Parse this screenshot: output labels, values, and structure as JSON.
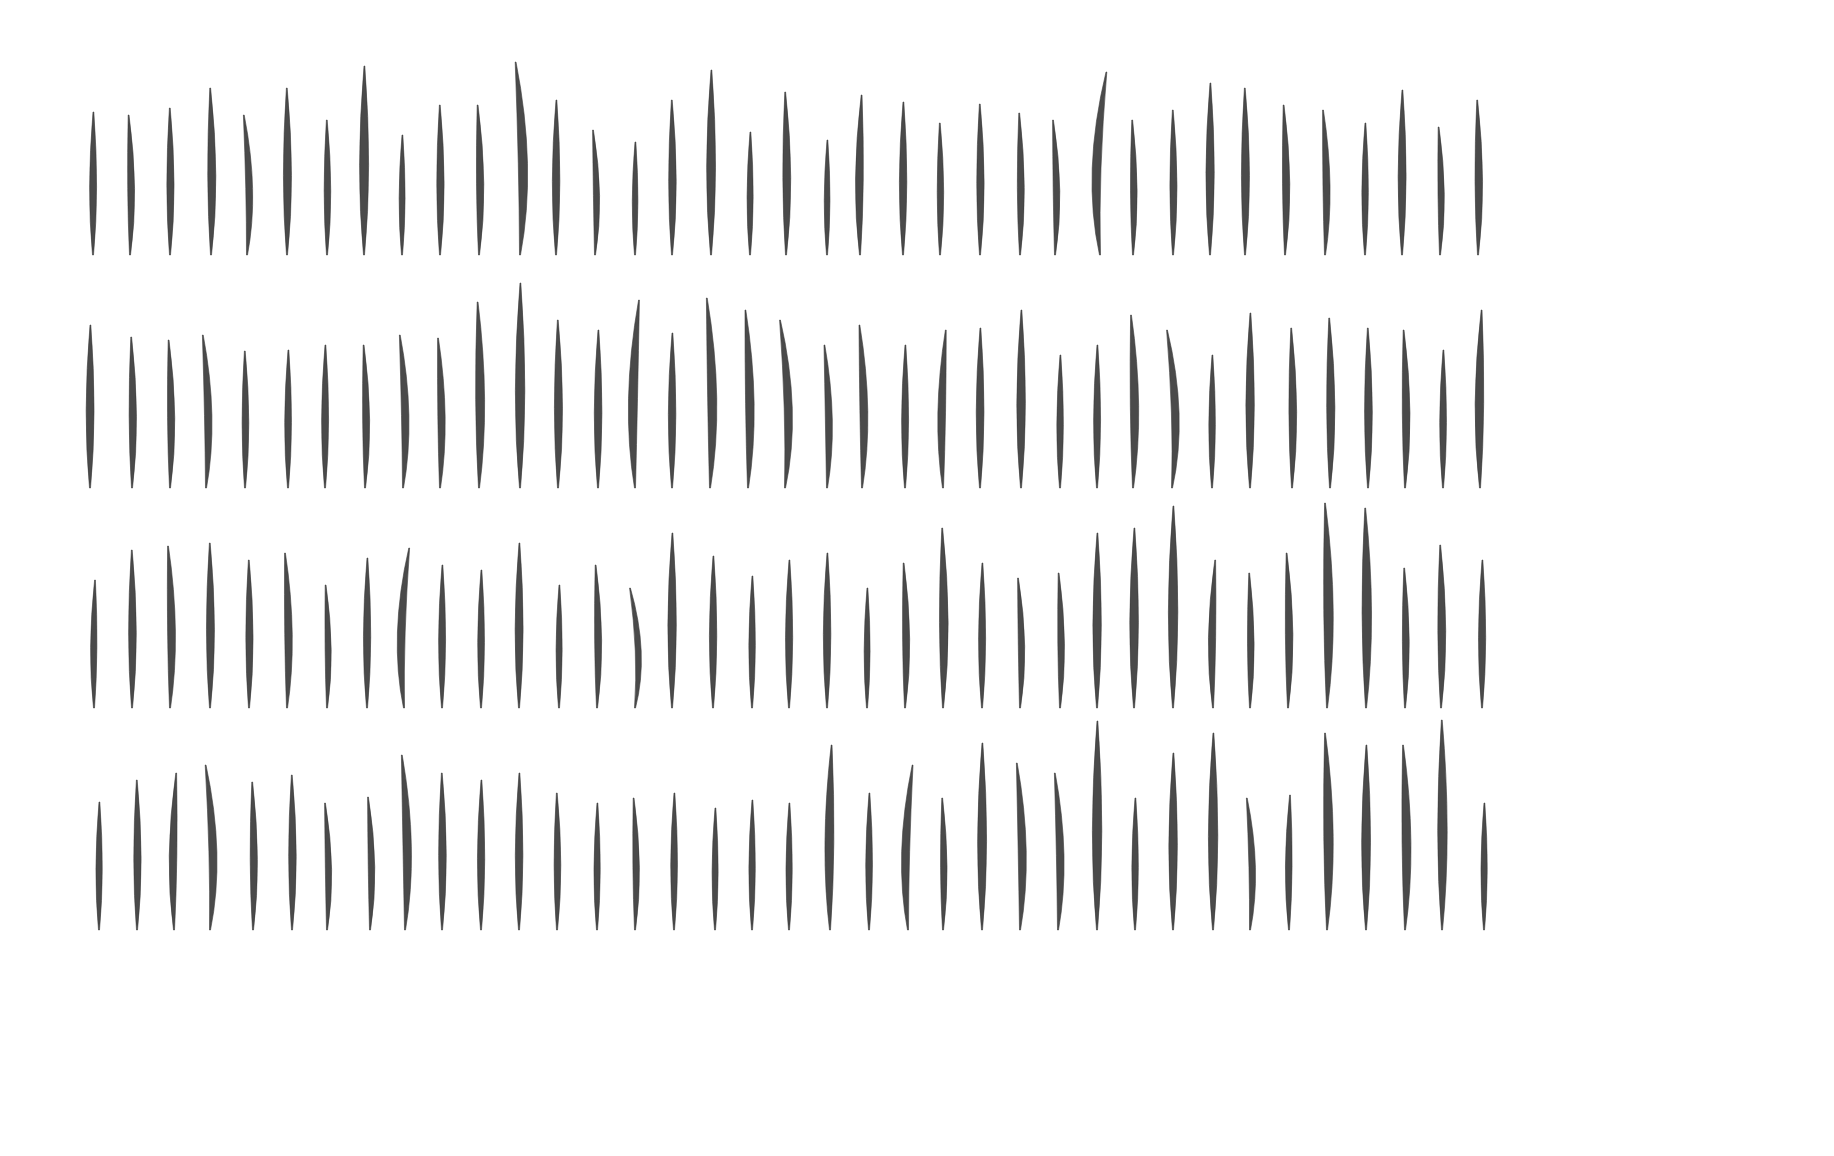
{
  "image": {
    "description": "Four rows of dark grey, narrow, slightly curved leaf-like specimens on a white background",
    "background": "#ffffff",
    "leaf_color": "#4a4a4a"
  },
  "rows": [
    {
      "bottom": 255,
      "leaves": [
        [
          93,
          112,
          0
        ],
        [
          130,
          115,
          3
        ],
        [
          170,
          108,
          1
        ],
        [
          211,
          88,
          2
        ],
        [
          247,
          115,
          6
        ],
        [
          287,
          88,
          1
        ],
        [
          327,
          120,
          1
        ],
        [
          364,
          66,
          0
        ],
        [
          402,
          135,
          0
        ],
        [
          440,
          105,
          1
        ],
        [
          479,
          105,
          3
        ],
        [
          520,
          62,
          8
        ],
        [
          556,
          100,
          0
        ],
        [
          595,
          130,
          4
        ],
        [
          635,
          142,
          0
        ],
        [
          672,
          100,
          1
        ],
        [
          711,
          70,
          0
        ],
        [
          750,
          132,
          0
        ],
        [
          786,
          92,
          2
        ],
        [
          827,
          140,
          0
        ],
        [
          860,
          95,
          -2
        ],
        [
          903,
          102,
          0
        ],
        [
          940,
          123,
          1
        ],
        [
          980,
          104,
          1
        ],
        [
          1020,
          113,
          2
        ],
        [
          1055,
          120,
          4
        ],
        [
          1100,
          72,
          -10
        ],
        [
          1133,
          120,
          2
        ],
        [
          1173,
          110,
          1
        ],
        [
          1210,
          83,
          0
        ],
        [
          1245,
          88,
          1
        ],
        [
          1285,
          105,
          3
        ],
        [
          1325,
          110,
          4
        ],
        [
          1365,
          123,
          0
        ],
        [
          1402,
          90,
          0
        ],
        [
          1440,
          127,
          3
        ],
        [
          1478,
          100,
          2
        ]
      ]
    },
    {
      "bottom": 488,
      "leaves": [
        [
          90,
          325,
          0
        ],
        [
          132,
          337,
          2
        ],
        [
          170,
          340,
          3
        ],
        [
          206,
          335,
          6
        ],
        [
          245,
          351,
          1
        ],
        [
          288,
          350,
          0
        ],
        [
          325,
          345,
          0
        ],
        [
          365,
          345,
          3
        ],
        [
          403,
          335,
          6
        ],
        [
          440,
          338,
          4
        ],
        [
          479,
          302,
          3
        ],
        [
          520,
          283,
          0
        ],
        [
          558,
          320,
          1
        ],
        [
          598,
          330,
          0
        ],
        [
          635,
          300,
          -6
        ],
        [
          672,
          333,
          0
        ],
        [
          710,
          298,
          6
        ],
        [
          748,
          310,
          5
        ],
        [
          785,
          320,
          9
        ],
        [
          827,
          345,
          5
        ],
        [
          862,
          325,
          5
        ],
        [
          905,
          345,
          0
        ],
        [
          943,
          330,
          -4
        ],
        [
          980,
          328,
          0
        ],
        [
          1021,
          310,
          0
        ],
        [
          1060,
          355,
          0
        ],
        [
          1097,
          345,
          0
        ],
        [
          1133,
          315,
          4
        ],
        [
          1172,
          330,
          9
        ],
        [
          1212,
          355,
          0
        ],
        [
          1250,
          313,
          0
        ],
        [
          1292,
          328,
          2
        ],
        [
          1330,
          318,
          2
        ],
        [
          1368,
          328,
          1
        ],
        [
          1405,
          330,
          3
        ],
        [
          1443,
          350,
          0
        ],
        [
          1480,
          310,
          -2
        ]
      ]
    },
    {
      "bottom": 708,
      "leaves": [
        [
          94,
          580,
          -1
        ],
        [
          132,
          550,
          1
        ],
        [
          170,
          546,
          4
        ],
        [
          210,
          543,
          1
        ],
        [
          249,
          560,
          1
        ],
        [
          287,
          553,
          4
        ],
        [
          327,
          585,
          3
        ],
        [
          367,
          558,
          0
        ],
        [
          404,
          548,
          -8
        ],
        [
          442,
          565,
          0
        ],
        [
          481,
          570,
          0
        ],
        [
          519,
          543,
          0
        ],
        [
          559,
          585,
          0
        ],
        [
          597,
          565,
          3
        ],
        [
          635,
          588,
          9
        ],
        [
          672,
          533,
          0
        ],
        [
          713,
          556,
          0
        ],
        [
          752,
          576,
          0
        ],
        [
          789,
          560,
          0
        ],
        [
          827,
          553,
          0
        ],
        [
          867,
          588,
          0
        ],
        [
          905,
          563,
          3
        ],
        [
          943,
          528,
          2
        ],
        [
          982,
          563,
          0
        ],
        [
          1020,
          578,
          4
        ],
        [
          1060,
          573,
          3
        ],
        [
          1097,
          533,
          0
        ],
        [
          1134,
          528,
          0
        ],
        [
          1173,
          506,
          0
        ],
        [
          1213,
          560,
          -3
        ],
        [
          1250,
          573,
          2
        ],
        [
          1288,
          553,
          3
        ],
        [
          1327,
          503,
          4
        ],
        [
          1366,
          508,
          2
        ],
        [
          1405,
          568,
          2
        ],
        [
          1441,
          545,
          2
        ],
        [
          1482,
          560,
          0
        ]
      ]
    },
    {
      "bottom": 930,
      "leaves": [
        [
          99,
          802,
          0
        ],
        [
          137,
          780,
          1
        ],
        [
          174,
          773,
          -3
        ],
        [
          210,
          765,
          8
        ],
        [
          253,
          782,
          2
        ],
        [
          292,
          775,
          1
        ],
        [
          327,
          803,
          4
        ],
        [
          370,
          797,
          4
        ],
        [
          405,
          755,
          6
        ],
        [
          442,
          773,
          1
        ],
        [
          481,
          780,
          0
        ],
        [
          519,
          773,
          0
        ],
        [
          557,
          793,
          1
        ],
        [
          597,
          803,
          0
        ],
        [
          635,
          798,
          3
        ],
        [
          674,
          793,
          0
        ],
        [
          715,
          808,
          0
        ],
        [
          752,
          800,
          0
        ],
        [
          789,
          803,
          0
        ],
        [
          830,
          745,
          -2
        ],
        [
          869,
          793,
          0
        ],
        [
          908,
          765,
          -7
        ],
        [
          943,
          798,
          2
        ],
        [
          982,
          743,
          0
        ],
        [
          1020,
          763,
          6
        ],
        [
          1058,
          773,
          6
        ],
        [
          1097,
          721,
          0
        ],
        [
          1135,
          798,
          0
        ],
        [
          1173,
          753,
          0
        ],
        [
          1213,
          733,
          0
        ],
        [
          1250,
          798,
          6
        ],
        [
          1289,
          795,
          -1
        ],
        [
          1327,
          733,
          4
        ],
        [
          1366,
          745,
          0
        ],
        [
          1405,
          745,
          4
        ],
        [
          1442,
          720,
          1
        ],
        [
          1484,
          803,
          0
        ]
      ]
    }
  ]
}
